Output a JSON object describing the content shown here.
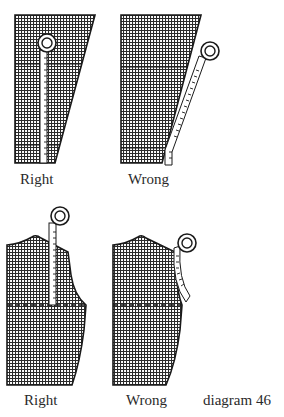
{
  "diagram": {
    "caption": "diagram 46",
    "colors": {
      "ink": "#1a1a1a",
      "paper": "#ffffff",
      "grid": "#2b2b2b"
    },
    "figures": [
      {
        "id": "top-right-example",
        "label": "Right",
        "type": "skirt-panel",
        "verdict": "correct",
        "description": "Tape measure held straight/vertical along grain"
      },
      {
        "id": "top-wrong-example",
        "label": "Wrong",
        "type": "skirt-panel",
        "verdict": "incorrect",
        "description": "Tape measure angled along slanted side seam"
      },
      {
        "id": "bottom-right-example",
        "label": "Right",
        "type": "bodice-panel",
        "verdict": "correct",
        "description": "Tape measure held vertical to waistline"
      },
      {
        "id": "bottom-wrong-example",
        "label": "Wrong",
        "type": "bodice-panel",
        "verdict": "incorrect",
        "description": "Tape measure curved along armhole"
      }
    ]
  }
}
